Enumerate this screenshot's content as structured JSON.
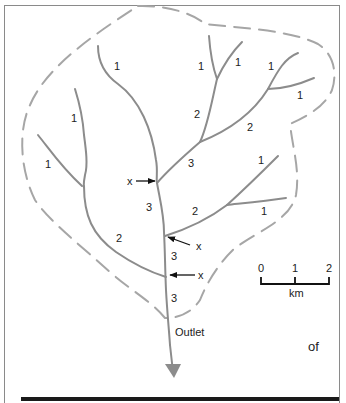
{
  "figure": {
    "type": "stream-order-drainage-basin-map",
    "outlet_label": "Outlet",
    "caption_fragment": "of",
    "junction_marker": "x",
    "stream_orders": [
      {
        "id": "top-left-trib",
        "order": "1",
        "x": 119,
        "y": 69
      },
      {
        "id": "left-upper-trib",
        "order": "1",
        "x": 76,
        "y": 122
      },
      {
        "id": "left-lower-trib",
        "order": "1",
        "x": 49,
        "y": 168
      },
      {
        "id": "top-mid-left-trib",
        "order": "1",
        "x": 201,
        "y": 70
      },
      {
        "id": "top-mid-right-trib",
        "order": "1",
        "x": 238,
        "y": 65
      },
      {
        "id": "top-right-upper-trib",
        "order": "1",
        "x": 271,
        "y": 70
      },
      {
        "id": "top-right-lower-trib",
        "order": "1",
        "x": 300,
        "y": 98
      },
      {
        "id": "upper-second-order",
        "order": "2",
        "x": 198,
        "y": 117
      },
      {
        "id": "right-second-order",
        "order": "2",
        "x": 250,
        "y": 130
      },
      {
        "id": "upper-third-order",
        "order": "3",
        "x": 191,
        "y": 166
      },
      {
        "id": "mid-right-upper-trib",
        "order": "1",
        "x": 261,
        "y": 163
      },
      {
        "id": "mid-right-lower-trib",
        "order": "1",
        "x": 264,
        "y": 214
      },
      {
        "id": "mid-second-order",
        "order": "2",
        "x": 196,
        "y": 214
      },
      {
        "id": "main-third-upper",
        "order": "3",
        "x": 150,
        "y": 208
      },
      {
        "id": "left-second-order",
        "order": "2",
        "x": 119,
        "y": 240
      },
      {
        "id": "main-third-middle",
        "order": "3",
        "x": 175,
        "y": 258
      },
      {
        "id": "main-third-lower",
        "order": "3",
        "x": 175,
        "y": 299
      }
    ],
    "junction_markers": [
      {
        "label": "x",
        "x": 127,
        "y": 183
      },
      {
        "label": "x",
        "x": 197,
        "y": 249
      },
      {
        "label": "x",
        "x": 199,
        "y": 277
      }
    ],
    "scale_bar": {
      "ticks": [
        "0",
        "1",
        "2"
      ],
      "unit": "km"
    },
    "colors": {
      "stream": "#8c8c8c",
      "boundary": "#a6a6a6",
      "arrow": "#111111",
      "frame": "#8a8a8a",
      "bottom_rule": "#1a1a1a"
    }
  }
}
